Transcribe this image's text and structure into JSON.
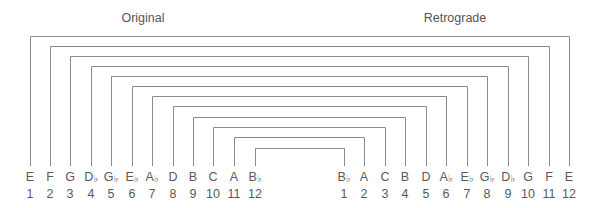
{
  "titles": {
    "original": "Original",
    "retrograde": "Retrograde"
  },
  "colors": {
    "line": "#8a8a8a",
    "text": "#5a5a5a",
    "background": "#ffffff"
  },
  "original": {
    "title_x": 143,
    "notes": [
      {
        "pitch": "E",
        "accidental": "",
        "number": "1",
        "x": 30
      },
      {
        "pitch": "F",
        "accidental": "",
        "number": "2",
        "x": 50
      },
      {
        "pitch": "G",
        "accidental": "",
        "number": "3",
        "x": 70
      },
      {
        "pitch": "D",
        "accidental": "♭",
        "number": "4",
        "x": 91
      },
      {
        "pitch": "G",
        "accidental": "♭",
        "number": "5",
        "x": 111
      },
      {
        "pitch": "E",
        "accidental": "♭",
        "number": "6",
        "x": 132
      },
      {
        "pitch": "A",
        "accidental": "♭",
        "number": "7",
        "x": 152
      },
      {
        "pitch": "D",
        "accidental": "",
        "number": "8",
        "x": 173
      },
      {
        "pitch": "B",
        "accidental": "",
        "number": "9",
        "x": 193
      },
      {
        "pitch": "C",
        "accidental": "",
        "number": "10",
        "x": 213
      },
      {
        "pitch": "A",
        "accidental": "",
        "number": "11",
        "x": 234
      },
      {
        "pitch": "B",
        "accidental": "♭",
        "number": "12",
        "x": 255
      }
    ]
  },
  "retrograde": {
    "title_x": 455,
    "notes": [
      {
        "pitch": "B",
        "accidental": "♭",
        "number": "1",
        "x": 344
      },
      {
        "pitch": "A",
        "accidental": "",
        "number": "2",
        "x": 364
      },
      {
        "pitch": "C",
        "accidental": "",
        "number": "3",
        "x": 385
      },
      {
        "pitch": "B",
        "accidental": "",
        "number": "4",
        "x": 405
      },
      {
        "pitch": "D",
        "accidental": "",
        "number": "5",
        "x": 426
      },
      {
        "pitch": "A",
        "accidental": "♭",
        "number": "6",
        "x": 446
      },
      {
        "pitch": "E",
        "accidental": "♭",
        "number": "7",
        "x": 467
      },
      {
        "pitch": "G",
        "accidental": "♭",
        "number": "8",
        "x": 487
      },
      {
        "pitch": "D",
        "accidental": "♭",
        "number": "9",
        "x": 508
      },
      {
        "pitch": "G",
        "accidental": "",
        "number": "10",
        "x": 528
      },
      {
        "pitch": "F",
        "accidental": "",
        "number": "11",
        "x": 549
      },
      {
        "pitch": "E",
        "accidental": "",
        "number": "12",
        "x": 569
      }
    ]
  },
  "brackets": {
    "bottom_y": 166,
    "levels_y": [
      36,
      46,
      56,
      66,
      76,
      86,
      96,
      106,
      117,
      127,
      137,
      148
    ]
  }
}
